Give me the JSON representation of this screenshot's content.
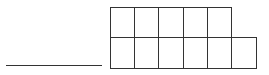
{
  "diagram": {
    "type": "blank answer line with grid of empty boxes",
    "stroke_color": "#333333",
    "background": "#ffffff",
    "answer_line": {
      "x1": 6,
      "x2": 102,
      "y": 66
    },
    "grid": {
      "origin": {
        "x": 110,
        "y": 7
      },
      "cell_width": 24.2,
      "cell_height": 30,
      "rows": [
        {
          "row": 1,
          "boxes": 5
        },
        {
          "row": 2,
          "boxes": 6
        }
      ],
      "total_boxes": 11
    }
  }
}
